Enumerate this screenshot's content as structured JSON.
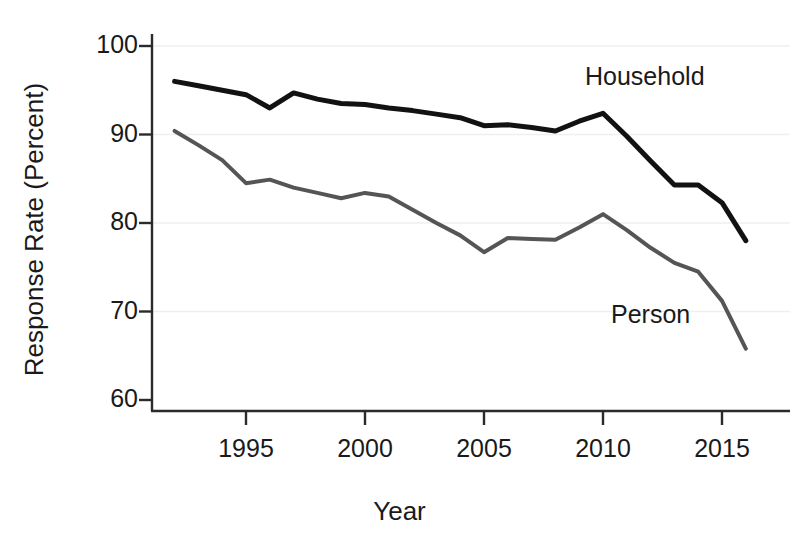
{
  "chart_data": {
    "type": "line",
    "title": "",
    "subtitle": "",
    "xlabel": "Year",
    "ylabel": "Response Rate (Percent)",
    "xlim": [
      1991.3,
      1916.0
    ],
    "x_axis_range": [
      1991.3,
      2016.6
    ],
    "ylim": [
      57.0,
      101.5
    ],
    "y_ticks": [
      60,
      70,
      80,
      90,
      100
    ],
    "y_tick_labels": [
      "60",
      "70",
      "80",
      "90",
      "100"
    ],
    "x_ticks": [
      1995,
      2000,
      2005,
      2010,
      2015
    ],
    "x_tick_labels": [
      "1995",
      "2000",
      "2005",
      "2010",
      "2015"
    ],
    "grid": "horizontal-faint",
    "legend_position": "inline-annotations",
    "x": [
      1992,
      1993,
      1994,
      1995,
      1996,
      1997,
      1998,
      1999,
      2000,
      2001,
      2002,
      2003,
      2004,
      2005,
      2006,
      2007,
      2008,
      2009,
      2010,
      2011,
      2012,
      2013,
      2014,
      2015,
      2016
    ],
    "series": [
      {
        "name": "Household",
        "color": "#121212",
        "width": 5,
        "label_text": "Household",
        "values": [
          96.0,
          95.5,
          95.0,
          94.5,
          93.0,
          94.7,
          94.0,
          93.5,
          93.4,
          93.0,
          92.7,
          92.3,
          91.9,
          91.0,
          91.1,
          90.8,
          90.4,
          91.5,
          92.4,
          89.8,
          87.0,
          84.3,
          84.3,
          82.3,
          78.0
        ]
      },
      {
        "name": "Person",
        "color": "#555555",
        "width": 4,
        "label_text": "Person",
        "values": [
          90.4,
          88.8,
          87.1,
          84.5,
          84.9,
          84.0,
          83.4,
          82.8,
          83.4,
          83.0,
          81.5,
          80.0,
          78.6,
          76.7,
          78.3,
          78.2,
          78.1,
          79.5,
          81.0,
          79.2,
          77.2,
          75.5,
          74.5,
          71.2,
          65.8
        ]
      }
    ]
  },
  "axes": {
    "y_title": "Response Rate (Percent)",
    "x_title": "Year"
  },
  "annotations": {
    "household": "Household",
    "person": "Person"
  }
}
